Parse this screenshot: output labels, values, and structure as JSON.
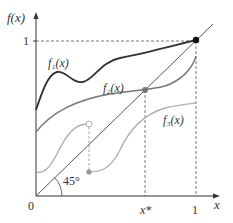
{
  "figure": {
    "y_axis_label": "f(x)",
    "x_axis_label": "x",
    "origin_label": "0",
    "y_tick_one": "1",
    "x_tick_xstar": "x*",
    "x_tick_one": "1",
    "angle_label": "45°",
    "curves": [
      {
        "name": "f1",
        "label": "f₁(x)",
        "color": "#333333",
        "description": "continuous function with one fixed point at x = 1"
      },
      {
        "name": "f2",
        "label": "f₂(x)",
        "color": "#777777",
        "description": "continuous function with fixed point at x*"
      },
      {
        "name": "f3",
        "label": "f₃(x)",
        "color": "#b0b0b0",
        "description": "discontinuous function with no fixed point"
      }
    ],
    "diagonal": {
      "label": "45° line y = x",
      "color": "#444444"
    },
    "fixed_points": [
      {
        "curve": "f1",
        "x": "1",
        "y": "1",
        "color": "#111111"
      },
      {
        "curve": "f2",
        "x": "x*",
        "y": "x*",
        "color": "#777777"
      }
    ],
    "discontinuity": {
      "curve": "f3",
      "open_point_color": "#b0b0b0",
      "closed_point_color": "#999999"
    }
  }
}
